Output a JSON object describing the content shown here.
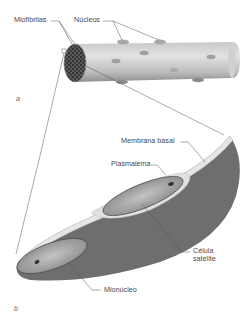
{
  "figure": {
    "panel_a": {
      "letter": "a",
      "labels": {
        "myofibrils": "Miofibrilas",
        "nuclei": "Núcleos"
      }
    },
    "panel_b": {
      "letter": "b",
      "labels": {
        "basal_membrane": "Membrana basal",
        "plasmalemma": "Plasmalema",
        "satellite_cell_line1": "Célula",
        "satellite_cell_line2": "satélite",
        "myonucleus": "Mionúcleo"
      }
    }
  },
  "colors": {
    "fiber_light": "#d8d8d8",
    "fiber_dark": "#7a7a7a",
    "cross_section": "#3a3a3a",
    "cytoplasm_dark": "#6e6e6e",
    "membrane_light": "#e4e4e4",
    "cell_gray": "#9c9c9c",
    "line": "#555555"
  }
}
